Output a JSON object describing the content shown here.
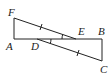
{
  "diagram": {
    "type": "geometry",
    "line_color": "#222222",
    "points": {
      "A": {
        "label": "A",
        "x": 14,
        "y": 39
      },
      "B": {
        "label": "B",
        "x": 102,
        "y": 39
      },
      "C": {
        "label": "C",
        "x": 102,
        "y": 61
      },
      "D": {
        "label": "D",
        "x": 37,
        "y": 39
      },
      "E": {
        "label": "E",
        "x": 76,
        "y": 39
      },
      "F": {
        "label": "F",
        "x": 14,
        "y": 18
      }
    },
    "segments": [
      "FA",
      "AB",
      "BC",
      "FE",
      "DC"
    ],
    "tick_marks": [
      "FE",
      "DC"
    ],
    "angle_marks": [
      "FED",
      "EDC"
    ]
  }
}
